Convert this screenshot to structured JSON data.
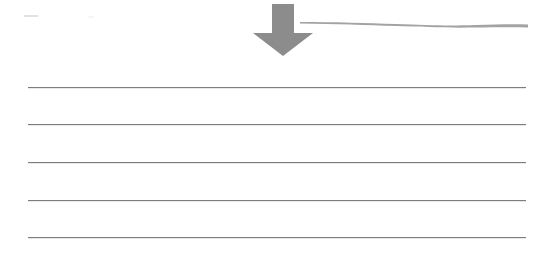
{
  "worksheet": {
    "arrow": {
      "icon": "down-arrow-icon",
      "color": "#8c8c8c"
    },
    "brush_stroke": {
      "color": "#a0a0a0"
    },
    "top_left_mark": {
      "color": "#cfcfcf"
    },
    "writing_lines": {
      "count": 5,
      "color": "#7d7d7d",
      "y_positions": [
        87,
        124,
        162,
        200,
        237
      ]
    }
  }
}
